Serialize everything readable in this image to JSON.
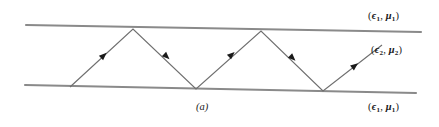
{
  "figure": {
    "caption": "(a)",
    "labels": {
      "top_medium": {
        "eps": "ϵ",
        "eps_sub": "1",
        "mu": "μ",
        "mu_sub": "1"
      },
      "core_medium": {
        "eps": "ϵ",
        "eps_sub": "2",
        "mu": "μ",
        "mu_sub": "2"
      },
      "bottom_medium": {
        "eps": "ϵ",
        "eps_sub": "1",
        "mu": "μ",
        "mu_sub": "1"
      }
    },
    "colors": {
      "boundary_line": "#8a8a8a",
      "ray_line": "#6f6f6f",
      "arrow_fill": "#1a1a1a",
      "text": "#1a1a1a",
      "background": "#ffffff"
    },
    "geometry": {
      "top_boundary": {
        "x1": 26,
        "y1": 25,
        "x2": 421,
        "y2": 32
      },
      "bottom_boundary": {
        "x1": 25,
        "y1": 85,
        "x2": 416,
        "y2": 93
      },
      "ray_vertices": [
        {
          "x": 70,
          "y": 87
        },
        {
          "x": 133,
          "y": 29
        },
        {
          "x": 196,
          "y": 89
        },
        {
          "x": 261,
          "y": 31
        },
        {
          "x": 323,
          "y": 91
        },
        {
          "x": 382,
          "y": 45
        }
      ],
      "arrowheads": [
        {
          "x": 101,
          "y": 58,
          "dir": "up-right"
        },
        {
          "x": 164,
          "y": 54,
          "dir": "down-right"
        },
        {
          "x": 229,
          "y": 57,
          "dir": "up-right"
        },
        {
          "x": 290,
          "y": 56,
          "dir": "down-right"
        },
        {
          "x": 352,
          "y": 68,
          "dir": "up-right"
        }
      ]
    }
  }
}
